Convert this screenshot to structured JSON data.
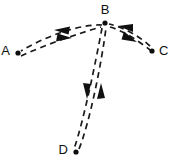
{
  "diagram": {
    "type": "directed-graph",
    "title": "",
    "background_color": "#ffffff",
    "stroke_color": "#1a1a1a",
    "line_style": "dashed",
    "nodes": [
      {
        "id": "A",
        "label": "A",
        "x": 18,
        "y": 53,
        "label_x": 10,
        "label_y": 51,
        "label_anchor": "end"
      },
      {
        "id": "B",
        "label": "B",
        "x": 105,
        "y": 23,
        "label_x": 105,
        "label_y": 11,
        "label_anchor": "middle"
      },
      {
        "id": "C",
        "label": "C",
        "x": 152,
        "y": 51,
        "label_x": 159,
        "label_y": 51,
        "label_anchor": "start"
      },
      {
        "id": "D",
        "label": "D",
        "x": 76,
        "y": 152,
        "label_x": 68,
        "label_y": 150,
        "label_anchor": "end"
      }
    ],
    "edges": [
      {
        "id": "B-to-A",
        "from": "B",
        "to": "A",
        "direction": "B→A",
        "arrow_label": "arrow-toward-A"
      },
      {
        "id": "A-to-B",
        "from": "A",
        "to": "B",
        "direction": "A→B",
        "arrow_label": "arrow-toward-B"
      },
      {
        "id": "B-to-C",
        "from": "B",
        "to": "C",
        "direction": "B→C",
        "arrow_label": "arrow-toward-C"
      },
      {
        "id": "C-to-B",
        "from": "C",
        "to": "B",
        "direction": "C→B",
        "arrow_label": "arrow-toward-B"
      },
      {
        "id": "B-to-D",
        "from": "B",
        "to": "D",
        "direction": "B→D",
        "arrow_label": "arrow-toward-D"
      },
      {
        "id": "D-to-B",
        "from": "D",
        "to": "B",
        "direction": "D→B",
        "arrow_label": "arrow-toward-B"
      }
    ]
  }
}
